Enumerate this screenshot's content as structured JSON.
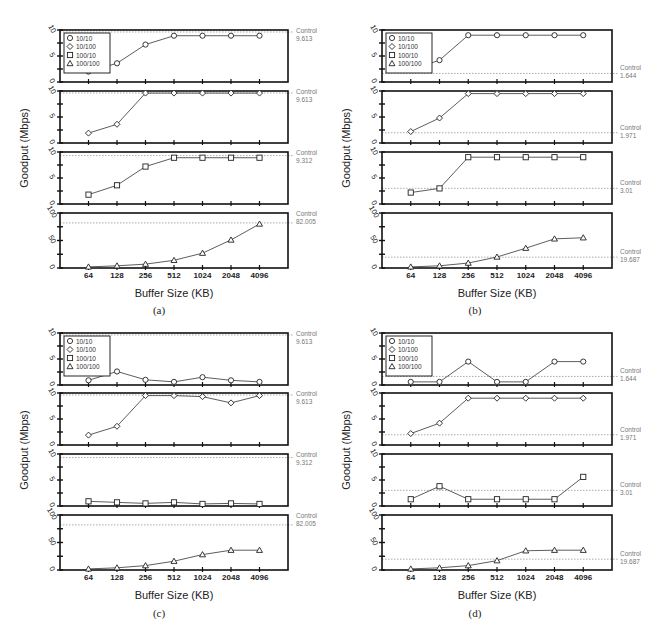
{
  "x_categories": [
    "64",
    "128",
    "256",
    "512",
    "1024",
    "2048",
    "4096"
  ],
  "ylabel": "Goodput (Mbps)",
  "xlabel": "Buffer Size (KB)",
  "legend": [
    {
      "label": "10/10",
      "marker": "circle"
    },
    {
      "label": "10/100",
      "marker": "diamond"
    },
    {
      "label": "100/10",
      "marker": "square"
    },
    {
      "label": "100/100",
      "marker": "triangle"
    }
  ],
  "control_label": "Control",
  "chart_data": [
    {
      "id": "a",
      "caption": "(a)",
      "type": "line",
      "xlabel": "Buffer Size (KB)",
      "ylabel": "Goodput (Mbps)",
      "categories": [
        "64",
        "128",
        "256",
        "512",
        "1024",
        "2048",
        "4096"
      ],
      "panels": [
        {
          "series": "10/10",
          "marker": "circle",
          "ylim": [
            0,
            10
          ],
          "yticks": [
            "0",
            "5",
            "10"
          ],
          "values": [
            2.0,
            3.6,
            7.2,
            8.9,
            8.9,
            8.9,
            8.9
          ],
          "control": 9.613,
          "control_label": "9.613"
        },
        {
          "series": "10/100",
          "marker": "diamond",
          "ylim": [
            0,
            10
          ],
          "yticks": [
            "0",
            "5",
            "10"
          ],
          "values": [
            1.9,
            3.6,
            9.6,
            9.6,
            9.6,
            9.6,
            9.6
          ],
          "control": 9.613,
          "control_label": "9.613"
        },
        {
          "series": "100/10",
          "marker": "square",
          "ylim": [
            0,
            10
          ],
          "yticks": [
            "0",
            "5",
            "10"
          ],
          "values": [
            1.8,
            3.6,
            7.2,
            8.9,
            8.9,
            8.9,
            8.9
          ],
          "control": 9.312,
          "control_label": "9.312"
        },
        {
          "series": "100/100",
          "marker": "triangle",
          "ylim": [
            0,
            100
          ],
          "yticks": [
            "0",
            "50",
            "100"
          ],
          "values": [
            2,
            4,
            7,
            14,
            27,
            51,
            80
          ],
          "control": 82.005,
          "control_label": "82.005"
        }
      ]
    },
    {
      "id": "b",
      "caption": "(b)",
      "type": "line",
      "xlabel": "Buffer Size (KB)",
      "ylabel": "Goodput (Mbps)",
      "categories": [
        "64",
        "128",
        "256",
        "512",
        "1024",
        "2048",
        "4096"
      ],
      "panels": [
        {
          "series": "10/10",
          "marker": "circle",
          "ylim": [
            0,
            10
          ],
          "yticks": [
            "0",
            "5",
            "10"
          ],
          "values": [
            2.3,
            4.2,
            9.0,
            9.0,
            9.0,
            9.0,
            9.0
          ],
          "control": 1.644,
          "control_label": "1.644"
        },
        {
          "series": "10/100",
          "marker": "diamond",
          "ylim": [
            0,
            10
          ],
          "yticks": [
            "0",
            "5",
            "10"
          ],
          "values": [
            2.2,
            4.8,
            9.5,
            9.5,
            9.5,
            9.5,
            9.5
          ],
          "control": 1.971,
          "control_label": "1.971"
        },
        {
          "series": "100/10",
          "marker": "square",
          "ylim": [
            0,
            10
          ],
          "yticks": [
            "0",
            "5",
            "10"
          ],
          "values": [
            2.2,
            3.0,
            9.0,
            9.0,
            9.0,
            9.0,
            9.0
          ],
          "control": 3.01,
          "control_label": "3.01"
        },
        {
          "series": "100/100",
          "marker": "triangle",
          "ylim": [
            0,
            100
          ],
          "yticks": [
            "0",
            "50",
            "100"
          ],
          "values": [
            2,
            4,
            9,
            20,
            36,
            53,
            55
          ],
          "control": 19.687,
          "control_label": "19.687"
        }
      ]
    },
    {
      "id": "c",
      "caption": "(c)",
      "type": "line",
      "xlabel": "Buffer Size (KB)",
      "ylabel": "Goodput (Mbps)",
      "categories": [
        "64",
        "128",
        "256",
        "512",
        "1024",
        "2048",
        "4096"
      ],
      "panels": [
        {
          "series": "10/10",
          "marker": "circle",
          "ylim": [
            0,
            10
          ],
          "yticks": [
            "0",
            "5",
            "10"
          ],
          "values": [
            0.9,
            2.6,
            1.0,
            0.6,
            1.5,
            0.9,
            0.6
          ],
          "control": 9.613,
          "control_label": "9.613"
        },
        {
          "series": "10/100",
          "marker": "diamond",
          "ylim": [
            0,
            10
          ],
          "yticks": [
            "0",
            "5",
            "10"
          ],
          "values": [
            1.9,
            3.6,
            9.5,
            9.5,
            9.3,
            8.1,
            9.5
          ],
          "control": 9.613,
          "control_label": "9.613"
        },
        {
          "series": "100/10",
          "marker": "square",
          "ylim": [
            0,
            10
          ],
          "yticks": [
            "0",
            "5",
            "10"
          ],
          "values": [
            0.9,
            0.7,
            0.5,
            0.7,
            0.4,
            0.5,
            0.4
          ],
          "control": 9.312,
          "control_label": "9.312"
        },
        {
          "series": "100/100",
          "marker": "triangle",
          "ylim": [
            0,
            100
          ],
          "yticks": [
            "0",
            "50",
            "100"
          ],
          "values": [
            2,
            4,
            8,
            16,
            28,
            36,
            36
          ],
          "control": 82.005,
          "control_label": "82.005"
        }
      ]
    },
    {
      "id": "d",
      "caption": "(d)",
      "type": "line",
      "xlabel": "Buffer Size (KB)",
      "ylabel": "Goodput (Mbps)",
      "categories": [
        "64",
        "128",
        "256",
        "512",
        "1024",
        "2048",
        "4096"
      ],
      "panels": [
        {
          "series": "10/10",
          "marker": "circle",
          "ylim": [
            0,
            10
          ],
          "yticks": [
            "0",
            "5",
            "10"
          ],
          "values": [
            0.6,
            0.6,
            4.5,
            0.6,
            0.6,
            4.5,
            4.5
          ],
          "control": 1.644,
          "control_label": "1.644"
        },
        {
          "series": "10/100",
          "marker": "diamond",
          "ylim": [
            0,
            10
          ],
          "yticks": [
            "0",
            "5",
            "10"
          ],
          "values": [
            2.2,
            4.2,
            9.0,
            9.0,
            9.0,
            9.0,
            9.0
          ],
          "control": 1.971,
          "control_label": "1.971"
        },
        {
          "series": "100/10",
          "marker": "square",
          "ylim": [
            0,
            10
          ],
          "yticks": [
            "0",
            "5",
            "10"
          ],
          "values": [
            1.3,
            3.8,
            1.3,
            1.3,
            1.3,
            1.3,
            5.6
          ],
          "control": 3.01,
          "control_label": "3.01"
        },
        {
          "series": "100/100",
          "marker": "triangle",
          "ylim": [
            0,
            100
          ],
          "yticks": [
            "0",
            "50",
            "100"
          ],
          "values": [
            2,
            4,
            8,
            17,
            35,
            36,
            36
          ],
          "control": 19.687,
          "control_label": "19.687"
        }
      ]
    }
  ]
}
